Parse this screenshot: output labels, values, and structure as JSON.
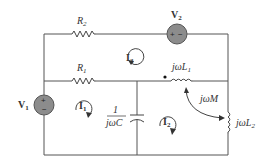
{
  "diagram": {
    "type": "ac-circuit-mesh-analysis",
    "components": {
      "R2": {
        "label": "R",
        "sub": "2"
      },
      "R1": {
        "label": "R",
        "sub": "1"
      },
      "V2": {
        "label": "V",
        "sub": "2",
        "polarity": "+ -"
      },
      "V1": {
        "label": "V",
        "sub": "1",
        "polarity": "+ -"
      },
      "L1": {
        "label": "jωL",
        "sub": "1"
      },
      "L2": {
        "label": "jωL",
        "sub": "2"
      },
      "C": {
        "num": "1",
        "den": "jωC"
      },
      "M": {
        "label": "jωM"
      }
    },
    "mesh_currents": [
      {
        "label": "I",
        "sub": "1"
      },
      {
        "label": "I",
        "sub": "2"
      },
      {
        "label": "I",
        "sub": "3"
      }
    ],
    "colors": {
      "source_fill": "#8c8c8c",
      "wire": "#555555"
    }
  }
}
